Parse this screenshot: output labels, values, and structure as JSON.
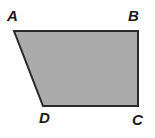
{
  "figure": {
    "kind": "geometry-diagram",
    "shape_name": "quadrilateral-trapezoid-ABCD",
    "background_color": "#ffffff",
    "fill_color": "#ababab",
    "stroke_color": "#2a2a2a",
    "stroke_width": 2,
    "polygon_points": "14,31 138,31 138,106 43,106",
    "vertices": [
      {
        "id": "A",
        "label": "A",
        "x": 14,
        "y": 31,
        "label_x": 7,
        "label_y": 8
      },
      {
        "id": "B",
        "label": "B",
        "x": 138,
        "y": 31,
        "label_x": 128,
        "label_y": 8
      },
      {
        "id": "C",
        "label": "C",
        "x": 138,
        "y": 106,
        "label_x": 132,
        "label_y": 112
      },
      {
        "id": "D",
        "label": "D",
        "x": 43,
        "y": 106,
        "label_x": 39,
        "label_y": 110
      }
    ],
    "edges": [
      {
        "from": "A",
        "to": "B",
        "name": "top-edge"
      },
      {
        "from": "B",
        "to": "C",
        "name": "right-edge"
      },
      {
        "from": "C",
        "to": "D",
        "name": "bottom-edge"
      },
      {
        "from": "D",
        "to": "A",
        "name": "left-slanted-edge"
      }
    ]
  }
}
